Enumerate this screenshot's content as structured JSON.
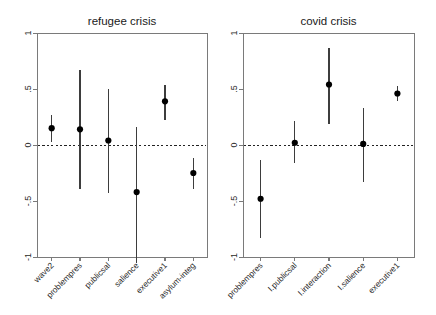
{
  "figure": {
    "width": 436,
    "height": 315,
    "background": "#ffffff",
    "panel_count": 2
  },
  "chart_data": [
    {
      "type": "scatter",
      "title": "refugee crisis",
      "panel": "left",
      "xlabel": "",
      "ylabel": "",
      "ylim": [
        -1,
        1
      ],
      "yticks": [
        1,
        0.5,
        0,
        -0.5,
        -1
      ],
      "ytick_labels": [
        "1",
        ".5",
        "0",
        "-.5",
        "-1"
      ],
      "grid": false,
      "legend": "none",
      "reference_line": 0,
      "reference_line_style": "dashed",
      "orientation": "vertical-intervals",
      "categories": [
        "wave2",
        "problempres",
        "publicsal",
        "salience",
        "executive1",
        "asylum-integ"
      ],
      "values": [
        0.15,
        0.14,
        0.04,
        -0.42,
        0.39,
        -0.25
      ],
      "ci_lower": [
        0.03,
        -0.39,
        -0.43,
        -1.05,
        0.22,
        -0.39
      ],
      "ci_upper": [
        0.27,
        0.67,
        0.5,
        0.16,
        0.54,
        -0.12
      ]
    },
    {
      "type": "scatter",
      "title": "covid crisis",
      "panel": "right",
      "xlabel": "",
      "ylabel": "",
      "ylim": [
        -1,
        1
      ],
      "yticks": [
        1,
        0.5,
        0,
        -0.5,
        -1
      ],
      "ytick_labels": [
        "1",
        ".5",
        "0",
        "-.5",
        "-1"
      ],
      "grid": false,
      "legend": "none",
      "reference_line": 0,
      "reference_line_style": "dashed",
      "orientation": "vertical-intervals",
      "categories": [
        "problempres",
        "I.publicsal",
        "I.interaction",
        "I.salience",
        "executive1"
      ],
      "values": [
        -0.48,
        0.02,
        0.54,
        0.01,
        0.46
      ],
      "ci_lower": [
        -0.83,
        -0.16,
        0.19,
        -0.33,
        0.39
      ],
      "ci_upper": [
        -0.13,
        0.21,
        0.87,
        0.33,
        0.53
      ]
    }
  ],
  "colors": {
    "point": "#000000",
    "interval": "#3d3d3d",
    "axis": "#7a7a7a",
    "reference": "#222222",
    "text": "#2a2a2a",
    "background": "#ffffff"
  }
}
